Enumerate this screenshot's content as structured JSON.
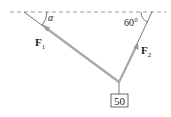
{
  "diagram": {
    "type": "force-diagram",
    "ceiling": {
      "style": "dashed"
    },
    "ropes": [
      {
        "id": "left",
        "force_label": "F",
        "force_subscript": "1",
        "angle_label": "α"
      },
      {
        "id": "right",
        "force_label": "F",
        "force_subscript": "2",
        "angle_label": "60°"
      }
    ],
    "weight": {
      "label": "50"
    },
    "colors": {
      "rope": "#555555",
      "arrow": "#a0a0a0",
      "ceiling": "#9a9a9a",
      "text": "#222222"
    }
  }
}
